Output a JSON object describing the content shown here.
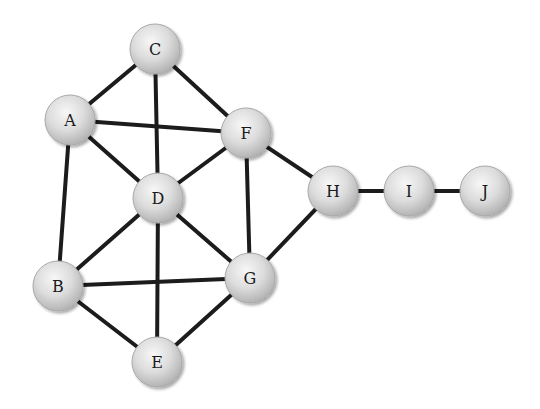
{
  "diagram": {
    "type": "undirected-graph",
    "nodes": [
      {
        "id": "C",
        "label": "C"
      },
      {
        "id": "A",
        "label": "A"
      },
      {
        "id": "F",
        "label": "F"
      },
      {
        "id": "D",
        "label": "D"
      },
      {
        "id": "H",
        "label": "H"
      },
      {
        "id": "I",
        "label": "I"
      },
      {
        "id": "J",
        "label": "J"
      },
      {
        "id": "B",
        "label": "B"
      },
      {
        "id": "G",
        "label": "G"
      },
      {
        "id": "E",
        "label": "E"
      }
    ],
    "edges": [
      [
        "A",
        "C"
      ],
      [
        "C",
        "D"
      ],
      [
        "C",
        "F"
      ],
      [
        "A",
        "F"
      ],
      [
        "A",
        "D"
      ],
      [
        "A",
        "B"
      ],
      [
        "D",
        "F"
      ],
      [
        "F",
        "G"
      ],
      [
        "F",
        "H"
      ],
      [
        "D",
        "B"
      ],
      [
        "D",
        "G"
      ],
      [
        "D",
        "E"
      ],
      [
        "B",
        "G"
      ],
      [
        "B",
        "E"
      ],
      [
        "G",
        "E"
      ],
      [
        "G",
        "H"
      ],
      [
        "H",
        "I"
      ],
      [
        "I",
        "J"
      ]
    ],
    "colors": {
      "edge": "#1c1c1c",
      "node_fill_light": "#f4f4f4",
      "node_fill_dark": "#b8b8b8",
      "node_stroke": "#a9a9a9",
      "label": "#1a1a1a"
    }
  }
}
